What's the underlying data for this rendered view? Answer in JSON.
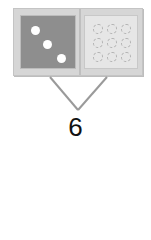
{
  "diagram": {
    "type": "number-bond-domino",
    "left_part": {
      "value": 3,
      "representation": "white dots on dark tile"
    },
    "right_part": {
      "value": 9,
      "representation": "dashed circles on light tile"
    },
    "whole_label": "6",
    "colors": {
      "left_tile": "#8e8e8e",
      "right_tile": "#e6e6e6",
      "frame": "#d6d6d6",
      "lines": "#9a9a9a"
    }
  }
}
